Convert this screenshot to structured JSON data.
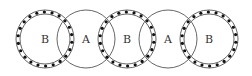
{
  "diagram": {
    "type": "overlapping-circles",
    "stroke_color": "#555555",
    "dot_color": "#111111",
    "background": "#ffffff",
    "center_y": 39,
    "outer_radius": 29,
    "inner_radius": 25,
    "dot_radius": 27,
    "dot_count": 22,
    "circles": [
      {
        "id": "b1",
        "label": "B",
        "cx": 45,
        "kind": "B"
      },
      {
        "id": "a1",
        "label": "A",
        "cx": 86,
        "kind": "A"
      },
      {
        "id": "b2",
        "label": "B",
        "cx": 127,
        "kind": "B"
      },
      {
        "id": "a2",
        "label": "A",
        "cx": 168,
        "kind": "A"
      },
      {
        "id": "b3",
        "label": "B",
        "cx": 209,
        "kind": "B"
      }
    ]
  }
}
